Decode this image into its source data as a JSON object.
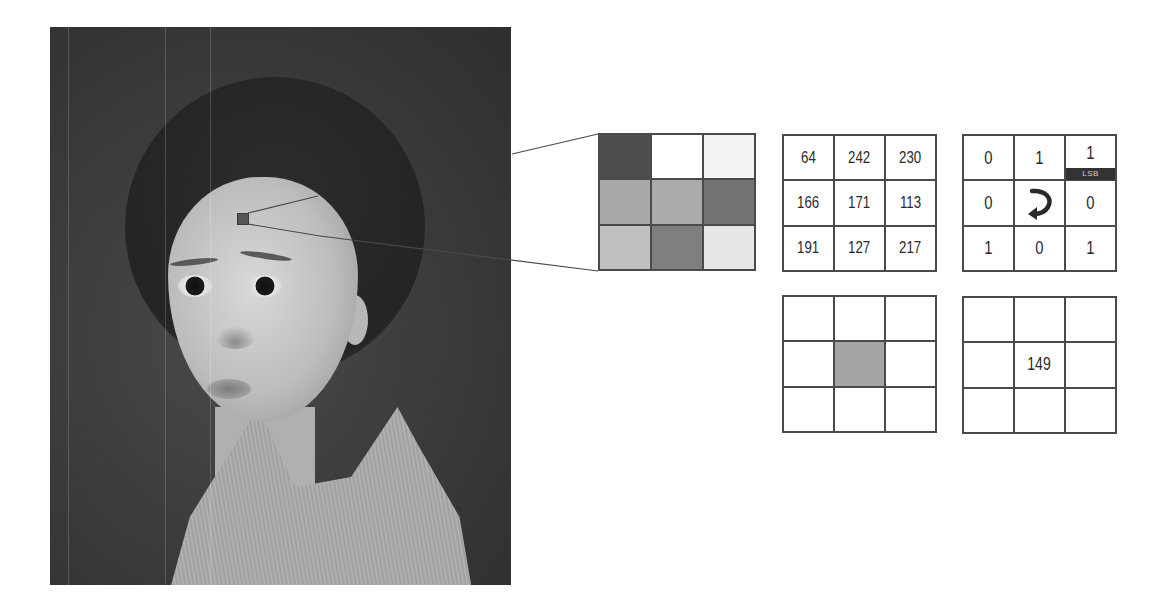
{
  "photo": {
    "subject": "grayscale portrait of a child",
    "marker_color": "#555555"
  },
  "pixel_grid": {
    "cells": [
      {
        "row": 0,
        "col": 0,
        "shade": "#4d4d4d"
      },
      {
        "row": 0,
        "col": 1,
        "shade": "#ffffff"
      },
      {
        "row": 0,
        "col": 2,
        "shade": "#f3f3f3"
      },
      {
        "row": 1,
        "col": 0,
        "shade": "#a8a8a8"
      },
      {
        "row": 1,
        "col": 1,
        "shade": "#ababab"
      },
      {
        "row": 1,
        "col": 2,
        "shade": "#737373"
      },
      {
        "row": 2,
        "col": 0,
        "shade": "#c0c0c0"
      },
      {
        "row": 2,
        "col": 1,
        "shade": "#7f7f7f"
      },
      {
        "row": 2,
        "col": 2,
        "shade": "#e6e6e6"
      }
    ]
  },
  "value_grid": {
    "rows": [
      [
        "64",
        "242",
        "230"
      ],
      [
        "166",
        "171",
        "113"
      ],
      [
        "191",
        "127",
        "217"
      ]
    ]
  },
  "bit_grid": {
    "rows": [
      [
        "0",
        "1",
        "1"
      ],
      [
        "0",
        "",
        "0"
      ],
      [
        "1",
        "0",
        "1"
      ]
    ],
    "lsb_label": "LSB",
    "center_icon": "curved-arrow-icon"
  },
  "highlight_grid": {
    "center_shade": "#a5a5a5"
  },
  "result_grid": {
    "center_value": "149"
  },
  "colors": {
    "line": "#4a4a4a",
    "text": "#2a2a2a",
    "lsb_bg": "#333333"
  }
}
